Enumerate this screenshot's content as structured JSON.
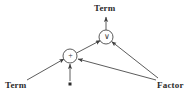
{
  "diagram": {
    "background_color": "#ffffff",
    "stroke_color": "#4a4a4a",
    "text_color": "#2b2b2b",
    "labels": {
      "term_top": "Term",
      "term_left": "Term",
      "factor_right": "Factor"
    },
    "nodes": [
      {
        "id": "or-node",
        "symbol": "∨",
        "shape": "circle",
        "cx": 106,
        "cy": 37,
        "r": 7
      },
      {
        "id": "plus-node",
        "symbol": "+",
        "shape": "circle",
        "cx": 70,
        "cy": 56,
        "r": 7
      },
      {
        "id": "dot-marker",
        "symbol": "■",
        "shape": "square",
        "cx": 70,
        "cy": 84,
        "size": 3
      }
    ],
    "edges": [
      {
        "id": "edge-or-to-term-top",
        "from": "or-node",
        "to": "term-top-label",
        "arrow": "to"
      },
      {
        "id": "edge-plus-to-or",
        "from": "plus-node",
        "to": "or-node",
        "arrow": "to"
      },
      {
        "id": "edge-factor-to-or",
        "from": "factor-label",
        "to": "or-node",
        "arrow": "to"
      },
      {
        "id": "edge-term-left-to-plus",
        "from": "term-left-label",
        "to": "plus-node",
        "arrow": "to"
      },
      {
        "id": "edge-dot-to-plus",
        "from": "dot-marker",
        "to": "plus-node",
        "arrow": "to"
      },
      {
        "id": "edge-factor-to-plus",
        "from": "factor-label",
        "to": "plus-node",
        "arrow": "to"
      }
    ]
  }
}
